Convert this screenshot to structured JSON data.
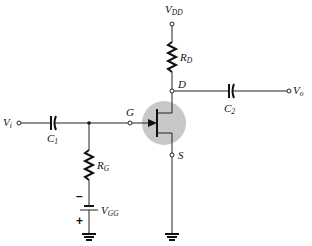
{
  "diagram": {
    "type": "JFET fixed-bias amplifier",
    "labels": {
      "vdd": {
        "main": "V",
        "sub": "DD"
      },
      "rd": {
        "main": "R",
        "sub": "D"
      },
      "drain": "D",
      "gate": "G",
      "source": "S",
      "c1": {
        "main": "C",
        "sub": "1"
      },
      "c2": {
        "main": "C",
        "sub": "2"
      },
      "vi": {
        "main": "V",
        "sub": "i"
      },
      "vo": {
        "main": "V",
        "sub": "o"
      },
      "rg": {
        "main": "R",
        "sub": "G"
      },
      "vgg": {
        "main": "V",
        "sub": "GG"
      },
      "minus": "–",
      "plus": "+"
    },
    "colors": {
      "jfet_body": "#c8c8c8",
      "wire": "#222222"
    }
  }
}
